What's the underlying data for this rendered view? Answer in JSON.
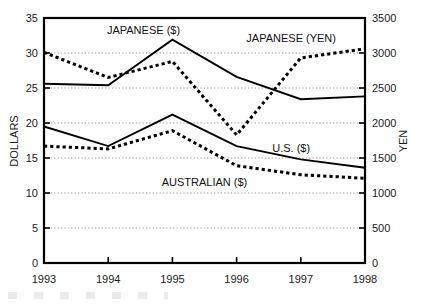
{
  "chart_data": {
    "type": "line",
    "title": "",
    "xlabel": "",
    "ylabel": "DOLLARS",
    "y2label": "YEN",
    "categories": [
      "1993",
      "1994",
      "1995",
      "1996",
      "1997",
      "1998"
    ],
    "x_tick_labels": [
      "1993",
      "1994",
      "1995",
      "1996",
      "1997",
      "1998"
    ],
    "ylim": [
      0,
      35
    ],
    "y_tick_labels": [
      "0",
      "5",
      "10",
      "15",
      "20",
      "25",
      "30",
      "35"
    ],
    "y_ticks": [
      0,
      5,
      10,
      15,
      20,
      25,
      30,
      35
    ],
    "y2lim": [
      0,
      3500
    ],
    "y2_tick_labels": [
      "0",
      "500",
      "1000",
      "1500",
      "2000",
      "2500",
      "3000",
      "3500"
    ],
    "y2_ticks": [
      0,
      500,
      1000,
      1500,
      2000,
      2500,
      3000,
      3500
    ],
    "grid": true,
    "legend_position": "inline-annotations",
    "series": [
      {
        "name": "JAPANESE ($)",
        "axis": "left",
        "style": "solid",
        "label": "JAPANESE ($)",
        "label_x": 1994.55,
        "label_y": 33.3,
        "values": [
          25.6,
          25.4,
          31.9,
          26.6,
          23.4,
          23.8
        ]
      },
      {
        "name": "JAPANESE (YEN)",
        "axis": "right",
        "style": "dashed",
        "label": "JAPANESE (YEN)",
        "label_x": 1996.85,
        "label_y": 3210,
        "values": [
          3010,
          2650,
          2880,
          1830,
          2930,
          3060
        ]
      },
      {
        "name": "U.S. ($)",
        "axis": "left",
        "style": "solid",
        "label": "U.S. ($)",
        "label_x": 1996.85,
        "label_y": 16.4,
        "values": [
          19.5,
          16.7,
          21.2,
          16.7,
          14.8,
          13.6
        ]
      },
      {
        "name": "AUSTRALIAN ($)",
        "axis": "left",
        "style": "dashed",
        "label": "AUSTRALIAN ($)",
        "label_x": 1995.5,
        "label_y": 11.6,
        "values": [
          16.7,
          16.3,
          18.9,
          13.9,
          12.6,
          12.1
        ]
      }
    ]
  }
}
